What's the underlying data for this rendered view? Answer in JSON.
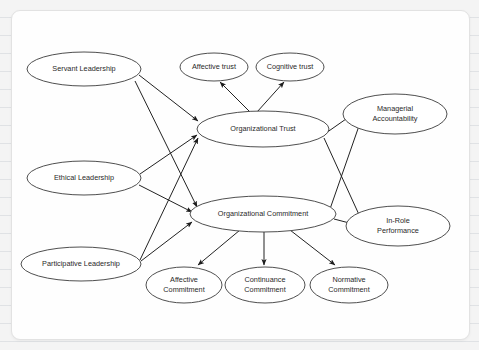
{
  "diagram": {
    "type": "path-model",
    "background_color": "#f4f4f4",
    "card_color": "#fefefe",
    "node_stroke_color": "#3b3b3b",
    "edge_color": "#222222",
    "nodes": [
      {
        "id": "servant_leadership",
        "label": "Servant Leadership",
        "label_line2": "",
        "cx": 72,
        "cy": 58,
        "rx": 57,
        "ry": 17
      },
      {
        "id": "ethical_leadership",
        "label": "Ethical Leadership",
        "label_line2": "",
        "cx": 72,
        "cy": 167,
        "rx": 57,
        "ry": 17
      },
      {
        "id": "participative_leadership",
        "label": "Participative Leadership",
        "label_line2": "",
        "cx": 69,
        "cy": 253,
        "rx": 60,
        "ry": 17
      },
      {
        "id": "affective_trust",
        "label": "Affective trust",
        "label_line2": "",
        "cx": 202,
        "cy": 56,
        "rx": 34,
        "ry": 14
      },
      {
        "id": "cognitive_trust",
        "label": "Cognitive trust",
        "label_line2": "",
        "cx": 278,
        "cy": 56,
        "rx": 34,
        "ry": 14
      },
      {
        "id": "organizational_trust",
        "label": "Organizational Trust",
        "label_line2": "",
        "cx": 251,
        "cy": 118,
        "rx": 66,
        "ry": 18
      },
      {
        "id": "organizational_commitment",
        "label": "Organizational Commitment",
        "label_line2": "",
        "cx": 251,
        "cy": 203,
        "rx": 73,
        "ry": 18
      },
      {
        "id": "managerial_accountability",
        "label": "Managerial",
        "label_line2": "Accountability",
        "cx": 383,
        "cy": 103,
        "rx": 52,
        "ry": 20
      },
      {
        "id": "in_role_performance",
        "label": "In-Role",
        "label_line2": "Performance",
        "cx": 386,
        "cy": 215,
        "rx": 52,
        "ry": 20
      },
      {
        "id": "affective_commitment",
        "label": "Affective",
        "label_line2": "Commitment",
        "cx": 172,
        "cy": 274,
        "rx": 38,
        "ry": 18
      },
      {
        "id": "continuance_commitment",
        "label": "Continuance",
        "label_line2": "Commitment",
        "cx": 253,
        "cy": 274,
        "rx": 40,
        "ry": 18
      },
      {
        "id": "normative_commitment",
        "label": "Normative",
        "label_line2": "Commitment",
        "cx": 337,
        "cy": 274,
        "rx": 39,
        "ry": 18
      }
    ],
    "edges": [
      {
        "from": "servant_leadership",
        "to": "organizational_trust",
        "x1": 127,
        "y1": 64,
        "x2": 186,
        "y2": 110
      },
      {
        "from": "servant_leadership",
        "to": "organizational_commitment",
        "x1": 123,
        "y1": 70,
        "x2": 185,
        "y2": 196
      },
      {
        "from": "ethical_leadership",
        "to": "organizational_trust",
        "x1": 128,
        "y1": 163,
        "x2": 185,
        "y2": 124
      },
      {
        "from": "ethical_leadership",
        "to": "organizational_commitment",
        "x1": 127,
        "y1": 174,
        "x2": 180,
        "y2": 201
      },
      {
        "from": "participative_leadership",
        "to": "organizational_trust",
        "x1": 128,
        "y1": 249,
        "x2": 186,
        "y2": 127
      },
      {
        "from": "participative_leadership",
        "to": "organizational_commitment",
        "x1": 129,
        "y1": 250,
        "x2": 180,
        "y2": 211
      },
      {
        "from": "organizational_trust",
        "to": "affective_trust",
        "x1": 238,
        "y1": 101,
        "x2": 208,
        "y2": 71
      },
      {
        "from": "organizational_trust",
        "to": "cognitive_trust",
        "x1": 245,
        "y1": 101,
        "x2": 272,
        "y2": 71
      },
      {
        "from": "organizational_trust",
        "to": "managerial_accountability",
        "x1": 314,
        "y1": 122,
        "x2": 344,
        "y2": 101
      },
      {
        "from": "organizational_trust",
        "to": "in_role_performance",
        "x1": 312,
        "y1": 127,
        "x2": 349,
        "y2": 208
      },
      {
        "from": "organizational_commitment",
        "to": "managerial_accountability",
        "x1": 318,
        "y1": 198,
        "x2": 348,
        "y2": 112
      },
      {
        "from": "organizational_commitment",
        "to": "in_role_performance",
        "x1": 322,
        "y1": 208,
        "x2": 345,
        "y2": 214
      },
      {
        "from": "organizational_commitment",
        "to": "affective_commitment",
        "x1": 228,
        "y1": 219,
        "x2": 186,
        "y2": 254
      },
      {
        "from": "organizational_commitment",
        "to": "continuance_commitment",
        "x1": 252,
        "y1": 221,
        "x2": 252,
        "y2": 254
      },
      {
        "from": "organizational_commitment",
        "to": "normative_commitment",
        "x1": 278,
        "y1": 219,
        "x2": 323,
        "y2": 254
      }
    ]
  }
}
